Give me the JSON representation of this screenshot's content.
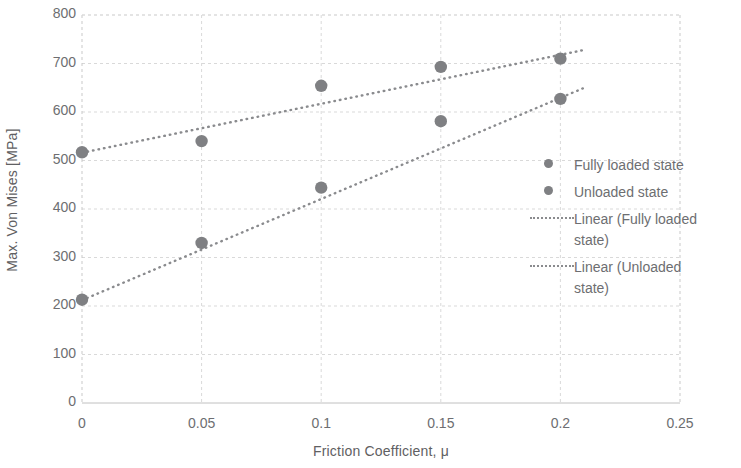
{
  "chart_data": {
    "type": "scatter",
    "title": "",
    "xlabel": "Friction Coefficient, μ",
    "ylabel": "Max. Von Mises [MPa]",
    "xlim": [
      0,
      0.25
    ],
    "ylim": [
      0,
      800
    ],
    "xticks": [
      "0",
      "0.05",
      "0.1",
      "0.15",
      "0.2",
      "0.25"
    ],
    "xtick_values": [
      0,
      0.05,
      0.1,
      0.15,
      0.2,
      0.25
    ],
    "yticks": [
      "0",
      "100",
      "200",
      "300",
      "400",
      "500",
      "600",
      "700",
      "800"
    ],
    "ytick_values": [
      0,
      100,
      200,
      300,
      400,
      500,
      600,
      700,
      800
    ],
    "grid": true,
    "grid_color": "#d9d9d9",
    "legend_position": "right",
    "marker_color": "#7f8083",
    "trendline_color": "#8a8b8e",
    "series": [
      {
        "name": "Fully loaded state",
        "marker": "circle",
        "x": [
          0,
          0.05,
          0.1,
          0.15,
          0.2
        ],
        "values": [
          517,
          540,
          654,
          693,
          710
        ]
      },
      {
        "name": "Unloaded state",
        "marker": "circle",
        "x": [
          0,
          0.05,
          0.1,
          0.15,
          0.2
        ],
        "values": [
          213,
          330,
          444,
          581,
          627
        ]
      },
      {
        "name": "Linear (Fully loaded state)",
        "marker": "dotted-line",
        "trendline_of": "Fully loaded state",
        "x": [
          0,
          0.21
        ],
        "values": [
          516,
          728
        ]
      },
      {
        "name": "Linear (Unloaded state)",
        "marker": "dotted-line",
        "trendline_of": "Unloaded state",
        "x": [
          0,
          0.21
        ],
        "values": [
          212,
          650
        ]
      }
    ]
  },
  "legend": {
    "items": [
      {
        "label": "Fully loaded state",
        "marker": "circle"
      },
      {
        "label": "Unloaded state",
        "marker": "circle"
      },
      {
        "label": "Linear (Fully loaded\nstate)",
        "marker": "dotted-line"
      },
      {
        "label": "Linear (Unloaded\nstate)",
        "marker": "dotted-line"
      }
    ]
  }
}
